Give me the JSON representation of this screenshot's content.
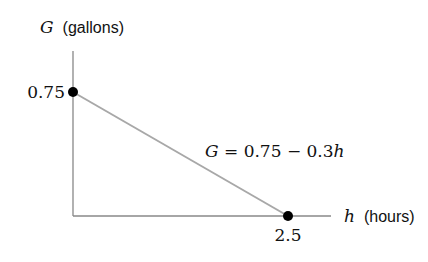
{
  "chart_data": {
    "type": "line",
    "title": "",
    "xlabel": {
      "var": "h",
      "unit": "(hours)"
    },
    "ylabel": {
      "var": "G",
      "unit": "(gallons)"
    },
    "xlim": [
      0,
      3.0
    ],
    "ylim": [
      0,
      1.0
    ],
    "grid": false,
    "series": [
      {
        "name": "G = 0.75 − 0.3h",
        "x": [
          0,
          2.5
        ],
        "y": [
          0.75,
          0
        ]
      }
    ],
    "points": [
      {
        "x": 0,
        "y": 0.75,
        "label": "0.75",
        "label_side": "left"
      },
      {
        "x": 2.5,
        "y": 0,
        "label": "2.5",
        "label_side": "below"
      }
    ],
    "annotation": {
      "lhs": "G",
      "rest": " = 0.75 − 0.3",
      "var": "h"
    },
    "colors": {
      "axis": "#888888",
      "line": "#a8a8a8",
      "point": "#000000"
    }
  }
}
